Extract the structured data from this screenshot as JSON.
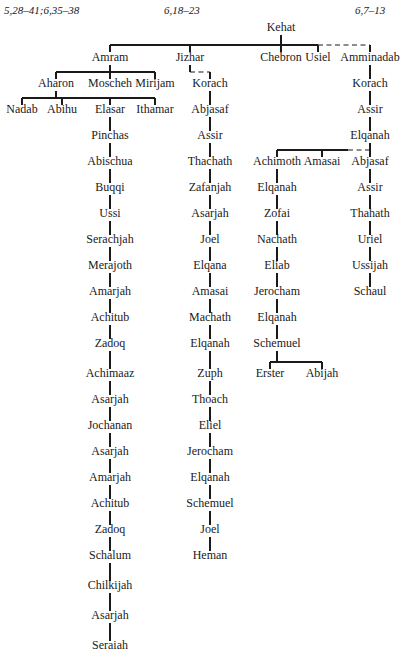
{
  "figure": {
    "width": 404,
    "height": 654,
    "line_color": "#1a1a1a",
    "text_color": "#1a1a1a",
    "background": "#ffffff"
  },
  "headers": [
    {
      "text": "5,28–41;6,35–38",
      "x": 4,
      "y": 14,
      "anchor": "start"
    },
    {
      "text": "6,18–23",
      "x": 164,
      "y": 14,
      "anchor": "start"
    },
    {
      "text": "6,7–13",
      "x": 355,
      "y": 14,
      "anchor": "start"
    }
  ],
  "nodes": [
    {
      "id": "kehat",
      "label": "Kehat",
      "x": 281,
      "y": 31
    },
    {
      "id": "amram",
      "label": "Amram",
      "x": 110,
      "y": 61
    },
    {
      "id": "jizhar",
      "label": "Jizhar",
      "x": 190,
      "y": 61
    },
    {
      "id": "chebron",
      "label": "Chebron",
      "x": 281,
      "y": 61
    },
    {
      "id": "usiel",
      "label": "Usiel",
      "x": 318,
      "y": 61
    },
    {
      "id": "amminadab",
      "label": "Amminadab",
      "x": 370,
      "y": 61
    },
    {
      "id": "aharon",
      "label": "Aharon",
      "x": 56,
      "y": 87
    },
    {
      "id": "moscheh",
      "label": "Moscheh",
      "x": 110,
      "y": 87
    },
    {
      "id": "mirijam",
      "label": "Mirijam",
      "x": 155,
      "y": 87
    },
    {
      "id": "korach_j",
      "label": "Korach",
      "x": 210,
      "y": 87
    },
    {
      "id": "korach_a",
      "label": "Korach",
      "x": 370,
      "y": 87
    },
    {
      "id": "nadab",
      "label": "Nadab",
      "x": 22,
      "y": 113
    },
    {
      "id": "abihu",
      "label": "Abihu",
      "x": 62,
      "y": 113
    },
    {
      "id": "elasar",
      "label": "Elasar",
      "x": 110,
      "y": 113
    },
    {
      "id": "ithamar",
      "label": "Ithamar",
      "x": 155,
      "y": 113
    },
    {
      "id": "abjasaf_j",
      "label": "Abjasaf",
      "x": 210,
      "y": 113
    },
    {
      "id": "assir_a",
      "label": "Assir",
      "x": 370,
      "y": 113
    },
    {
      "id": "pinchas",
      "label": "Pinchas",
      "x": 110,
      "y": 139
    },
    {
      "id": "assir_j",
      "label": "Assir",
      "x": 210,
      "y": 139
    },
    {
      "id": "elqanah_a",
      "label": "Elqanah",
      "x": 370,
      "y": 139
    },
    {
      "id": "abischua",
      "label": "Abischua",
      "x": 110,
      "y": 165
    },
    {
      "id": "thachath",
      "label": "Thachath",
      "x": 210,
      "y": 165
    },
    {
      "id": "achimoth",
      "label": "Achimoth",
      "x": 277,
      "y": 165
    },
    {
      "id": "amasai_r",
      "label": "Amasai",
      "x": 322,
      "y": 165
    },
    {
      "id": "abjasaf_r",
      "label": "Abjasaf",
      "x": 370,
      "y": 165
    },
    {
      "id": "buqqi",
      "label": "Buqqi",
      "x": 110,
      "y": 191
    },
    {
      "id": "zafanjah",
      "label": "Zafanjah",
      "x": 210,
      "y": 191
    },
    {
      "id": "elqanah_r1",
      "label": "Elqanah",
      "x": 277,
      "y": 191
    },
    {
      "id": "assir_r",
      "label": "Assir",
      "x": 370,
      "y": 191
    },
    {
      "id": "ussi",
      "label": "Ussi",
      "x": 110,
      "y": 217
    },
    {
      "id": "asarjah_m1",
      "label": "Asarjah",
      "x": 210,
      "y": 217
    },
    {
      "id": "zofai",
      "label": "Zofai",
      "x": 277,
      "y": 217
    },
    {
      "id": "thahath",
      "label": "Thahath",
      "x": 370,
      "y": 217
    },
    {
      "id": "serachjah",
      "label": "Serachjah",
      "x": 110,
      "y": 243
    },
    {
      "id": "joel_m",
      "label": "Joel",
      "x": 210,
      "y": 243
    },
    {
      "id": "nachath",
      "label": "Nachath",
      "x": 277,
      "y": 243
    },
    {
      "id": "uriel",
      "label": "Uriel",
      "x": 370,
      "y": 243
    },
    {
      "id": "merajoth",
      "label": "Merajoth",
      "x": 110,
      "y": 269
    },
    {
      "id": "elqana_m",
      "label": "Elqana",
      "x": 210,
      "y": 269
    },
    {
      "id": "eliab",
      "label": "Eliab",
      "x": 277,
      "y": 269
    },
    {
      "id": "ussijah",
      "label": "Ussijah",
      "x": 370,
      "y": 269
    },
    {
      "id": "amarjah_l1",
      "label": "Amarjah",
      "x": 110,
      "y": 295
    },
    {
      "id": "amasai_m",
      "label": "Amasai",
      "x": 210,
      "y": 295
    },
    {
      "id": "jerocham_r",
      "label": "Jerocham",
      "x": 277,
      "y": 295
    },
    {
      "id": "schaul",
      "label": "Schaul",
      "x": 370,
      "y": 295
    },
    {
      "id": "achitub_l1",
      "label": "Achitub",
      "x": 110,
      "y": 321
    },
    {
      "id": "machath",
      "label": "Machath",
      "x": 210,
      "y": 321
    },
    {
      "id": "elqanah_r2",
      "label": "Elqanah",
      "x": 277,
      "y": 321
    },
    {
      "id": "zadoq_l1",
      "label": "Zadoq",
      "x": 110,
      "y": 347
    },
    {
      "id": "elqanah_m1",
      "label": "Elqanah",
      "x": 210,
      "y": 347
    },
    {
      "id": "schemuel_r",
      "label": "Schemuel",
      "x": 277,
      "y": 347
    },
    {
      "id": "achimaaz",
      "label": "Achimaaz",
      "x": 110,
      "y": 377
    },
    {
      "id": "zuph",
      "label": "Zuph",
      "x": 210,
      "y": 377
    },
    {
      "id": "erster",
      "label": "Erster",
      "x": 270,
      "y": 377
    },
    {
      "id": "abijah",
      "label": "Abijah",
      "x": 322,
      "y": 377
    },
    {
      "id": "asarjah_l1",
      "label": "Asarjah",
      "x": 110,
      "y": 403
    },
    {
      "id": "thoach",
      "label": "Thoach",
      "x": 210,
      "y": 403
    },
    {
      "id": "jochanan",
      "label": "Jochanan",
      "x": 110,
      "y": 429
    },
    {
      "id": "eliel",
      "label": "Eliel",
      "x": 210,
      "y": 429
    },
    {
      "id": "asarjah_l2",
      "label": "Asarjah",
      "x": 110,
      "y": 455
    },
    {
      "id": "jerocham_m",
      "label": "Jerocham",
      "x": 210,
      "y": 455
    },
    {
      "id": "amarjah_l2",
      "label": "Amarjah",
      "x": 110,
      "y": 481
    },
    {
      "id": "elqanah_m2",
      "label": "Elqanah",
      "x": 210,
      "y": 481
    },
    {
      "id": "achitub_l2",
      "label": "Achitub",
      "x": 110,
      "y": 507
    },
    {
      "id": "schemuel_m",
      "label": "Schemuel",
      "x": 210,
      "y": 507
    },
    {
      "id": "zadoq_l2",
      "label": "Zadoq",
      "x": 110,
      "y": 533
    },
    {
      "id": "joel_m2",
      "label": "Joel",
      "x": 210,
      "y": 533
    },
    {
      "id": "schalum",
      "label": "Schalum",
      "x": 110,
      "y": 559
    },
    {
      "id": "heman",
      "label": "Heman",
      "x": 210,
      "y": 559
    },
    {
      "id": "chilkijah",
      "label": "Chilkijah",
      "x": 110,
      "y": 589
    },
    {
      "id": "asarjah_l3",
      "label": "Asarjah",
      "x": 110,
      "y": 619
    },
    {
      "id": "seraiah",
      "label": "Seraiah",
      "x": 110,
      "y": 649
    }
  ],
  "edges": [
    {
      "type": "vertical",
      "x": 281,
      "y1": 35,
      "y2": 45,
      "style": "solid"
    },
    {
      "type": "hbar",
      "x1": 110,
      "x2": 318,
      "y": 45,
      "style": "solid"
    },
    {
      "type": "hbar",
      "x1": 318,
      "x2": 370,
      "y": 45,
      "style": "dashed"
    },
    {
      "type": "vertical",
      "x": 110,
      "y1": 45,
      "y2": 52,
      "style": "solid"
    },
    {
      "type": "vertical",
      "x": 190,
      "y1": 45,
      "y2": 52,
      "style": "solid"
    },
    {
      "type": "vertical",
      "x": 281,
      "y1": 45,
      "y2": 52,
      "style": "solid"
    },
    {
      "type": "vertical",
      "x": 318,
      "y1": 45,
      "y2": 52,
      "style": "solid"
    },
    {
      "type": "vertical",
      "x": 370,
      "y1": 45,
      "y2": 52,
      "style": "solid"
    },
    {
      "type": "vertical",
      "x": 110,
      "y1": 65,
      "y2": 72,
      "style": "solid"
    },
    {
      "type": "hbar",
      "x1": 56,
      "x2": 155,
      "y": 72,
      "style": "solid"
    },
    {
      "type": "vertical",
      "x": 56,
      "y1": 72,
      "y2": 79,
      "style": "solid"
    },
    {
      "type": "vertical",
      "x": 110,
      "y1": 72,
      "y2": 79,
      "style": "solid"
    },
    {
      "type": "vertical",
      "x": 155,
      "y1": 72,
      "y2": 79,
      "style": "solid"
    },
    {
      "type": "vertical",
      "x": 190,
      "y1": 65,
      "y2": 72,
      "style": "solid"
    },
    {
      "type": "hbar",
      "x1": 190,
      "x2": 210,
      "y": 72,
      "style": "dashed"
    },
    {
      "type": "vertical",
      "x": 210,
      "y1": 72,
      "y2": 79,
      "style": "solid"
    },
    {
      "type": "vertical",
      "x": 370,
      "y1": 65,
      "y2": 79,
      "style": "solid"
    },
    {
      "type": "vertical",
      "x": 56,
      "y1": 91,
      "y2": 98,
      "style": "solid"
    },
    {
      "type": "hbar",
      "x1": 22,
      "x2": 155,
      "y": 98,
      "style": "solid"
    },
    {
      "type": "vertical",
      "x": 22,
      "y1": 98,
      "y2": 105,
      "style": "solid"
    },
    {
      "type": "vertical",
      "x": 62,
      "y1": 98,
      "y2": 105,
      "style": "solid"
    },
    {
      "type": "vertical",
      "x": 110,
      "y1": 98,
      "y2": 105,
      "style": "solid"
    },
    {
      "type": "vertical",
      "x": 155,
      "y1": 98,
      "y2": 105,
      "style": "solid"
    },
    {
      "type": "vertical",
      "x": 210,
      "y1": 91,
      "y2": 105,
      "style": "solid"
    },
    {
      "type": "vertical",
      "x": 370,
      "y1": 91,
      "y2": 105,
      "style": "solid"
    },
    {
      "type": "vertical",
      "x": 110,
      "y1": 117,
      "y2": 131,
      "style": "solid"
    },
    {
      "type": "vertical",
      "x": 210,
      "y1": 117,
      "y2": 131,
      "style": "solid"
    },
    {
      "type": "vertical",
      "x": 370,
      "y1": 117,
      "y2": 131,
      "style": "solid"
    },
    {
      "type": "vertical",
      "x": 110,
      "y1": 143,
      "y2": 157,
      "style": "solid"
    },
    {
      "type": "vertical",
      "x": 210,
      "y1": 143,
      "y2": 157,
      "style": "solid"
    },
    {
      "type": "vertical",
      "x": 370,
      "y1": 143,
      "y2": 150,
      "style": "solid"
    },
    {
      "type": "hbar",
      "x1": 277,
      "x2": 348,
      "y": 150,
      "style": "solid"
    },
    {
      "type": "hbar",
      "x1": 348,
      "x2": 370,
      "y": 150,
      "style": "dashed"
    },
    {
      "type": "vertical",
      "x": 277,
      "y1": 150,
      "y2": 157,
      "style": "solid"
    },
    {
      "type": "vertical",
      "x": 322,
      "y1": 150,
      "y2": 157,
      "style": "solid"
    },
    {
      "type": "vertical",
      "x": 370,
      "y1": 150,
      "y2": 157,
      "style": "solid"
    },
    {
      "type": "vertical",
      "x": 110,
      "y1": 169,
      "y2": 183,
      "style": "solid"
    },
    {
      "type": "vertical",
      "x": 210,
      "y1": 169,
      "y2": 183,
      "style": "solid"
    },
    {
      "type": "vertical",
      "x": 277,
      "y1": 169,
      "y2": 183,
      "style": "solid"
    },
    {
      "type": "vertical",
      "x": 370,
      "y1": 169,
      "y2": 183,
      "style": "solid"
    },
    {
      "type": "vertical",
      "x": 110,
      "y1": 195,
      "y2": 209,
      "style": "solid"
    },
    {
      "type": "vertical",
      "x": 210,
      "y1": 195,
      "y2": 209,
      "style": "solid"
    },
    {
      "type": "vertical",
      "x": 277,
      "y1": 195,
      "y2": 209,
      "style": "solid"
    },
    {
      "type": "vertical",
      "x": 370,
      "y1": 195,
      "y2": 209,
      "style": "solid"
    },
    {
      "type": "vertical",
      "x": 110,
      "y1": 221,
      "y2": 235,
      "style": "solid"
    },
    {
      "type": "vertical",
      "x": 210,
      "y1": 221,
      "y2": 235,
      "style": "solid"
    },
    {
      "type": "vertical",
      "x": 277,
      "y1": 221,
      "y2": 235,
      "style": "solid"
    },
    {
      "type": "vertical",
      "x": 370,
      "y1": 221,
      "y2": 235,
      "style": "solid"
    },
    {
      "type": "vertical",
      "x": 110,
      "y1": 247,
      "y2": 261,
      "style": "solid"
    },
    {
      "type": "vertical",
      "x": 210,
      "y1": 247,
      "y2": 261,
      "style": "solid"
    },
    {
      "type": "vertical",
      "x": 277,
      "y1": 247,
      "y2": 261,
      "style": "solid"
    },
    {
      "type": "vertical",
      "x": 370,
      "y1": 247,
      "y2": 261,
      "style": "solid"
    },
    {
      "type": "vertical",
      "x": 110,
      "y1": 273,
      "y2": 287,
      "style": "solid"
    },
    {
      "type": "vertical",
      "x": 210,
      "y1": 273,
      "y2": 287,
      "style": "solid"
    },
    {
      "type": "vertical",
      "x": 277,
      "y1": 273,
      "y2": 287,
      "style": "solid"
    },
    {
      "type": "vertical",
      "x": 370,
      "y1": 273,
      "y2": 287,
      "style": "solid"
    },
    {
      "type": "vertical",
      "x": 110,
      "y1": 299,
      "y2": 313,
      "style": "solid"
    },
    {
      "type": "vertical",
      "x": 210,
      "y1": 299,
      "y2": 313,
      "style": "solid"
    },
    {
      "type": "vertical",
      "x": 277,
      "y1": 299,
      "y2": 313,
      "style": "solid"
    },
    {
      "type": "vertical",
      "x": 110,
      "y1": 325,
      "y2": 339,
      "style": "solid"
    },
    {
      "type": "vertical",
      "x": 210,
      "y1": 325,
      "y2": 339,
      "style": "solid"
    },
    {
      "type": "vertical",
      "x": 277,
      "y1": 325,
      "y2": 339,
      "style": "solid"
    },
    {
      "type": "vertical",
      "x": 110,
      "y1": 351,
      "y2": 369,
      "style": "solid"
    },
    {
      "type": "vertical",
      "x": 210,
      "y1": 351,
      "y2": 369,
      "style": "solid"
    },
    {
      "type": "vertical",
      "x": 277,
      "y1": 351,
      "y2": 362,
      "style": "solid"
    },
    {
      "type": "hbar",
      "x1": 270,
      "x2": 322,
      "y": 362,
      "style": "solid"
    },
    {
      "type": "vertical",
      "x": 270,
      "y1": 362,
      "y2": 369,
      "style": "solid"
    },
    {
      "type": "vertical",
      "x": 322,
      "y1": 362,
      "y2": 369,
      "style": "solid"
    },
    {
      "type": "vertical",
      "x": 110,
      "y1": 381,
      "y2": 395,
      "style": "solid"
    },
    {
      "type": "vertical",
      "x": 210,
      "y1": 381,
      "y2": 395,
      "style": "solid"
    },
    {
      "type": "vertical",
      "x": 110,
      "y1": 407,
      "y2": 421,
      "style": "solid"
    },
    {
      "type": "vertical",
      "x": 210,
      "y1": 407,
      "y2": 421,
      "style": "solid"
    },
    {
      "type": "vertical",
      "x": 110,
      "y1": 433,
      "y2": 447,
      "style": "solid"
    },
    {
      "type": "vertical",
      "x": 210,
      "y1": 433,
      "y2": 447,
      "style": "solid"
    },
    {
      "type": "vertical",
      "x": 110,
      "y1": 459,
      "y2": 473,
      "style": "solid"
    },
    {
      "type": "vertical",
      "x": 210,
      "y1": 459,
      "y2": 473,
      "style": "solid"
    },
    {
      "type": "vertical",
      "x": 110,
      "y1": 485,
      "y2": 499,
      "style": "solid"
    },
    {
      "type": "vertical",
      "x": 210,
      "y1": 485,
      "y2": 499,
      "style": "solid"
    },
    {
      "type": "vertical",
      "x": 110,
      "y1": 511,
      "y2": 525,
      "style": "solid"
    },
    {
      "type": "vertical",
      "x": 210,
      "y1": 511,
      "y2": 525,
      "style": "solid"
    },
    {
      "type": "vertical",
      "x": 110,
      "y1": 537,
      "y2": 551,
      "style": "solid"
    },
    {
      "type": "vertical",
      "x": 210,
      "y1": 537,
      "y2": 551,
      "style": "solid"
    },
    {
      "type": "vertical",
      "x": 110,
      "y1": 563,
      "y2": 581,
      "style": "solid"
    },
    {
      "type": "vertical",
      "x": 110,
      "y1": 593,
      "y2": 611,
      "style": "solid"
    },
    {
      "type": "vertical",
      "x": 110,
      "y1": 623,
      "y2": 641,
      "style": "solid"
    }
  ]
}
